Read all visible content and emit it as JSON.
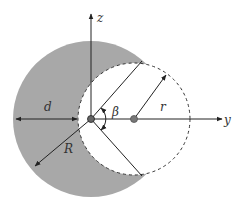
{
  "diagram": {
    "type": "geometry",
    "labels": {
      "z_axis": "z",
      "y_axis": "y",
      "big_radius": "R",
      "small_radius": "r",
      "angle": "β",
      "distance": "d"
    },
    "colors": {
      "shaded_fill": "#a8a8a8",
      "stroke": "#222222",
      "background": "#ffffff"
    },
    "geometry": {
      "big_circle": {
        "cx": 91,
        "cy": 119,
        "r": 78
      },
      "small_circle": {
        "cx": 134,
        "cy": 119,
        "r": 56
      },
      "intersection_top": {
        "x": 142,
        "y": 62
      },
      "intersection_bottom": {
        "x": 142,
        "y": 176
      }
    }
  }
}
